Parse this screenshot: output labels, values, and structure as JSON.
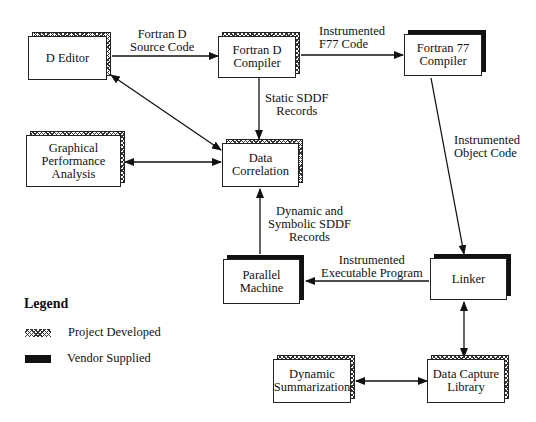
{
  "diagram": {
    "nodes": {
      "d_editor": {
        "label": "D Editor",
        "type": "project"
      },
      "fortran_d_compiler": {
        "label": "Fortran D\nCompiler",
        "type": "project"
      },
      "fortran77_compiler": {
        "label": "Fortran 77\nCompiler",
        "type": "vendor"
      },
      "graphical_performance_analysis": {
        "label": "Graphical\nPerformance\nAnalysis",
        "type": "project"
      },
      "data_correlation": {
        "label": "Data\nCorrelation",
        "type": "project"
      },
      "parallel_machine": {
        "label": "Parallel\nMachine",
        "type": "vendor"
      },
      "linker": {
        "label": "Linker",
        "type": "vendor"
      },
      "dynamic_summarization": {
        "label": "Dynamic\nSummarization",
        "type": "project"
      },
      "data_capture_library": {
        "label": "Data Capture\nLibrary",
        "type": "project"
      }
    },
    "edges": [
      {
        "from": "d_editor",
        "to": "fortran_d_compiler",
        "label": "Fortran D\nSource Code",
        "direction": "forward"
      },
      {
        "from": "fortran_d_compiler",
        "to": "fortran77_compiler",
        "label": "Instrumented\nF77 Code",
        "direction": "forward"
      },
      {
        "from": "fortran_d_compiler",
        "to": "data_correlation",
        "label": "Static SDDF\nRecords",
        "direction": "forward"
      },
      {
        "from": "d_editor",
        "to": "data_correlation",
        "label": "",
        "direction": "both"
      },
      {
        "from": "graphical_performance_analysis",
        "to": "data_correlation",
        "label": "",
        "direction": "both"
      },
      {
        "from": "fortran77_compiler",
        "to": "linker",
        "label": "Instrumented\nObject Code",
        "direction": "forward"
      },
      {
        "from": "parallel_machine",
        "to": "data_correlation",
        "label": "Dynamic and\nSymbolic SDDF\nRecords",
        "direction": "forward"
      },
      {
        "from": "linker",
        "to": "parallel_machine",
        "label": "Instrumented\nExecutable Program",
        "direction": "forward"
      },
      {
        "from": "linker",
        "to": "data_capture_library",
        "label": "",
        "direction": "both"
      },
      {
        "from": "dynamic_summarization",
        "to": "data_capture_library",
        "label": "",
        "direction": "both"
      }
    ]
  },
  "edge_labels": {
    "source_code": "Fortran D\nSource Code",
    "f77_code": "Instrumented\nF77 Code",
    "static_sddf": "Static SDDF\nRecords",
    "object_code": "Instrumented\nObject Code",
    "dynamic_sddf": "Dynamic and\nSymbolic SDDF\nRecords",
    "executable": "Instrumented\nExecutable Program"
  },
  "legend": {
    "title": "Legend",
    "items": [
      {
        "label": "Project Developed",
        "pattern": "checkered"
      },
      {
        "label": "Vendor Supplied",
        "pattern": "solid-black"
      }
    ]
  }
}
